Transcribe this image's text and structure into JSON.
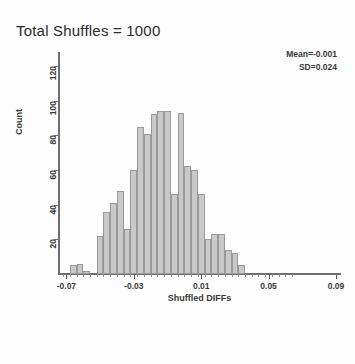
{
  "title": "Total Shuffles = 1000",
  "annotation": {
    "mean": "Mean=-0.001",
    "sd": "SD=0.024"
  },
  "axis_title_x": "Shuffled DIFFs",
  "axis_title_y": "Count",
  "colors": {
    "bar_fill": "#c9c9c9",
    "bar_edge": "#9a9a9a",
    "axis": "#6e6e6e",
    "text": "#3a3a3a",
    "background": "#fdfdfd"
  },
  "chart_data": {
    "type": "bar",
    "title": "Total Shuffles = 1000",
    "xlabel": "Shuffled DIFFs",
    "ylabel": "Count",
    "xlim": [
      -0.075,
      0.093
    ],
    "ylim": [
      0,
      128
    ],
    "grid": false,
    "legend": null,
    "bin_width": 0.004,
    "x_ticks": [
      -0.07,
      -0.03,
      0.01,
      0.05,
      0.09
    ],
    "x_tick_labels": [
      "-0.07",
      "-0.03",
      "0.01",
      "0.05",
      "0.09"
    ],
    "y_ticks": [
      20,
      40,
      60,
      80,
      100,
      120
    ],
    "y_tick_labels": [
      "20",
      "40",
      "60",
      "80",
      "100",
      "120"
    ],
    "annotations": [
      "Mean=-0.001",
      "SD=0.024"
    ],
    "bin_centers": [
      -0.07,
      -0.066,
      -0.062,
      -0.058,
      -0.054,
      -0.05,
      -0.046,
      -0.042,
      -0.038,
      -0.034,
      -0.03,
      -0.026,
      -0.022,
      -0.018,
      -0.014,
      -0.01,
      -0.006,
      -0.002,
      0.002,
      0.006,
      0.01,
      0.014,
      0.018,
      0.022,
      0.026,
      0.03,
      0.034,
      0.038,
      0.042,
      0.046,
      0.05,
      0.054,
      0.058,
      0.062
    ],
    "values": [
      0,
      5,
      6,
      2,
      0,
      22,
      36,
      41,
      48,
      26,
      60,
      85,
      81,
      92,
      94,
      94,
      46,
      93,
      62,
      60,
      46,
      20,
      23,
      23,
      14,
      12,
      5,
      0,
      0,
      0,
      0,
      0,
      0,
      0
    ],
    "categories": [
      "-0.070",
      "-0.066",
      "-0.062",
      "-0.058",
      "-0.054",
      "-0.050",
      "-0.046",
      "-0.042",
      "-0.038",
      "-0.034",
      "-0.030",
      "-0.026",
      "-0.022",
      "-0.018",
      "-0.014",
      "-0.010",
      "-0.006",
      "-0.002",
      "0.002",
      "0.006",
      "0.010",
      "0.014",
      "0.018",
      "0.022",
      "0.026",
      "0.030",
      "0.034",
      "0.038",
      "0.042",
      "0.046",
      "0.050",
      "0.054",
      "0.058",
      "0.062"
    ]
  }
}
